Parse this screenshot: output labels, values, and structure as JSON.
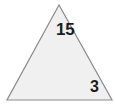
{
  "figure": {
    "type": "triangle-diagram",
    "background_color": "#ffffff",
    "shape": {
      "name": "triangle",
      "fill_color": "#f0f0f0",
      "stroke_color": "#8a8a8a",
      "stroke_width": 1.2,
      "points": "59,5 7,100 112,100",
      "vertices": [
        {
          "name": "apex",
          "x": 59,
          "y": 5
        },
        {
          "name": "bottom-left",
          "x": 7,
          "y": 100
        },
        {
          "name": "bottom-right",
          "x": 112,
          "y": 100
        }
      ]
    },
    "labels": [
      {
        "id": "apex-measure",
        "text": "15",
        "position": "interior-top",
        "color": "#1c1c1c"
      },
      {
        "id": "right-measure",
        "text": "3",
        "position": "interior-bottom-right",
        "color": "#1c1c1c"
      }
    ]
  }
}
